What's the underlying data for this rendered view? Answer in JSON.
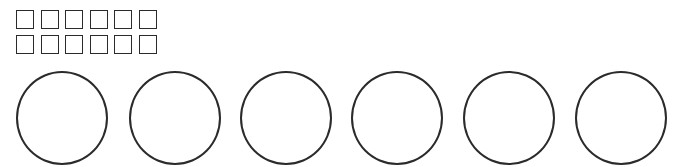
{
  "diagram": {
    "square_rows": [
      {
        "row": 1,
        "count": 6,
        "filled": [
          false,
          false,
          false,
          false,
          false,
          false
        ]
      },
      {
        "row": 2,
        "count": 6,
        "filled": [
          false,
          false,
          false,
          false,
          false,
          false
        ]
      }
    ],
    "circles": {
      "count": 6,
      "filled": [
        false,
        false,
        false,
        false,
        false,
        false
      ]
    },
    "colors": {
      "stroke": "#2b2b2b",
      "background": "#ffffff"
    }
  }
}
